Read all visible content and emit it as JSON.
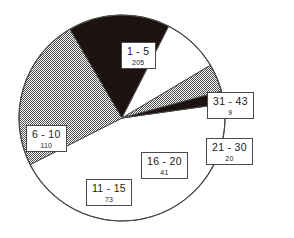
{
  "chart_data": {
    "type": "pie",
    "title": "",
    "subtitle": "",
    "xlabel": "",
    "ylabel": "",
    "legend_position": "callout-boxes",
    "grid": false,
    "total": 458,
    "categories": [
      "1 - 5",
      "6 - 10",
      "11 - 15",
      "16 - 20",
      "21 - 30",
      "31 - 43"
    ],
    "values": [
      205,
      110,
      73,
      41,
      20,
      9
    ],
    "slices": [
      {
        "label": "1 - 5",
        "value": 205,
        "percent": 44.8,
        "fill": "white",
        "start_deg": 352.0,
        "end_deg": 153.1
      },
      {
        "label": "6 - 10",
        "value": 110,
        "percent": 24.0,
        "fill": "gray",
        "start_deg": 153.1,
        "end_deg": 239.6
      },
      {
        "label": "11 - 15",
        "value": 73,
        "percent": 15.9,
        "fill": "black",
        "start_deg": 239.6,
        "end_deg": 297.0
      },
      {
        "label": "16 - 20",
        "value": 41,
        "percent": 9.0,
        "fill": "white",
        "start_deg": 297.0,
        "end_deg": 329.2
      },
      {
        "label": "21 - 30",
        "value": 20,
        "percent": 4.4,
        "fill": "gray",
        "start_deg": 329.2,
        "end_deg": 344.9
      },
      {
        "label": "31 - 43",
        "value": 9,
        "percent": 2.0,
        "fill": "black",
        "start_deg": 344.9,
        "end_deg": 352.0
      }
    ],
    "colors": {
      "white": "#ffffff",
      "gray": "#8c8c8c",
      "black": "#1c1210",
      "outline": "#4a4a4a",
      "background": "#ffffff",
      "text": "#1a1a1a"
    }
  }
}
